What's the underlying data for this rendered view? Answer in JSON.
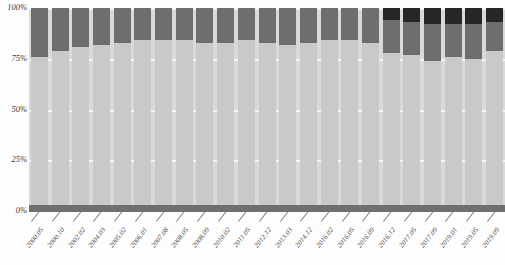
{
  "chart_data": {
    "type": "bar",
    "title": "",
    "subtitle": "",
    "xlabel": "",
    "ylabel": "",
    "stacked": true,
    "normalized_percent": true,
    "grid": true,
    "legend_position": "none",
    "ylim": [
      0,
      100
    ],
    "ytick_labels": [
      "0%",
      "25%",
      "50%",
      "75%",
      "100%"
    ],
    "ytick_values": [
      0,
      25,
      50,
      75,
      100
    ],
    "categories": [
      "2000.05",
      "2000.10",
      "2002.02",
      "2004.03",
      "2005.02",
      "2006.01",
      "2007.08",
      "2008.05",
      "2008.09",
      "2010.02",
      "2011.05",
      "2012.12",
      "2013.03",
      "2014.12",
      "2016.02",
      "2016.05",
      "2016.09",
      "2016.12",
      "2017.05",
      "2017.09",
      "2019.01",
      "2019.05",
      "2019.09"
    ],
    "series": [
      {
        "name": "segment-1",
        "color": "#c9c9c9",
        "values": [
          76,
          79,
          81,
          82,
          83,
          84,
          84,
          84,
          83,
          83,
          84,
          83,
          82,
          83,
          84,
          84,
          83,
          78,
          77,
          74,
          76,
          75,
          79
        ]
      },
      {
        "name": "segment-2",
        "color": "#6e6e6e",
        "values": [
          24,
          21,
          19,
          18,
          17,
          16,
          16,
          16,
          17,
          17,
          16,
          17,
          18,
          17,
          16,
          16,
          17,
          16,
          16,
          18,
          16,
          17,
          14
        ]
      },
      {
        "name": "segment-3",
        "color": "#262626",
        "values": [
          0,
          0,
          0,
          0,
          0,
          0,
          0,
          0,
          0,
          0,
          0,
          0,
          0,
          0,
          0,
          0,
          0,
          6,
          7,
          8,
          8,
          8,
          7
        ]
      }
    ]
  },
  "colors": {
    "plot_background": "#d9d9d9",
    "gridline": "#f4f4f4",
    "baseline": "#6f6f6f",
    "axis_text": "#3b3b3b",
    "segment_1": "#c9c9c9",
    "segment_2": "#6e6e6e",
    "segment_3": "#262626"
  }
}
